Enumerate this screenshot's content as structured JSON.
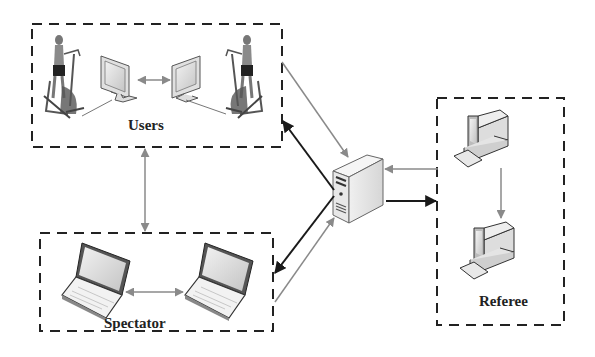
{
  "diagram": {
    "groups": {
      "users": {
        "label": "Users"
      },
      "spectator": {
        "label": "Spectator"
      },
      "referee": {
        "label": "Referee"
      }
    },
    "nodes": [
      {
        "id": "user-1-elliptical",
        "icon": "person-on-elliptical-trainer-icon",
        "group": "users"
      },
      {
        "id": "user-1-monitor",
        "icon": "monitor-icon",
        "group": "users"
      },
      {
        "id": "user-2-monitor",
        "icon": "monitor-icon",
        "group": "users"
      },
      {
        "id": "user-2-elliptical",
        "icon": "person-on-elliptical-trainer-icon",
        "group": "users"
      },
      {
        "id": "spectator-laptop-1",
        "icon": "laptop-icon",
        "group": "spectator"
      },
      {
        "id": "spectator-laptop-2",
        "icon": "laptop-icon",
        "group": "spectator"
      },
      {
        "id": "server",
        "icon": "server-tower-icon",
        "group": null
      },
      {
        "id": "referee-pc-1",
        "icon": "desktop-computer-icon",
        "group": "referee"
      },
      {
        "id": "referee-pc-2",
        "icon": "desktop-computer-icon",
        "group": "referee"
      }
    ],
    "edges": [
      {
        "from": "user-1-monitor",
        "to": "user-2-monitor",
        "style": "gray",
        "direction": "both"
      },
      {
        "from": "users",
        "to": "server",
        "style": "gray",
        "direction": "forward"
      },
      {
        "from": "server",
        "to": "users",
        "style": "black",
        "direction": "forward"
      },
      {
        "from": "users",
        "to": "spectator",
        "style": "gray",
        "direction": "both"
      },
      {
        "from": "spectator-laptop-1",
        "to": "spectator-laptop-2",
        "style": "gray",
        "direction": "both"
      },
      {
        "from": "server",
        "to": "spectator",
        "style": "black",
        "direction": "forward"
      },
      {
        "from": "spectator",
        "to": "server",
        "style": "gray",
        "direction": "forward"
      },
      {
        "from": "referee",
        "to": "server",
        "style": "gray",
        "direction": "forward"
      },
      {
        "from": "server",
        "to": "referee",
        "style": "black",
        "direction": "forward"
      },
      {
        "from": "referee-pc-1",
        "to": "referee-pc-2",
        "style": "gray",
        "direction": "forward"
      }
    ],
    "colors": {
      "dashed_border": "#222222",
      "gray_arrow": "#8a8a8a",
      "black_arrow": "#1a1a1a",
      "device_fill": "#e6e6e6",
      "screen_fill": "#d4d4d4"
    }
  }
}
